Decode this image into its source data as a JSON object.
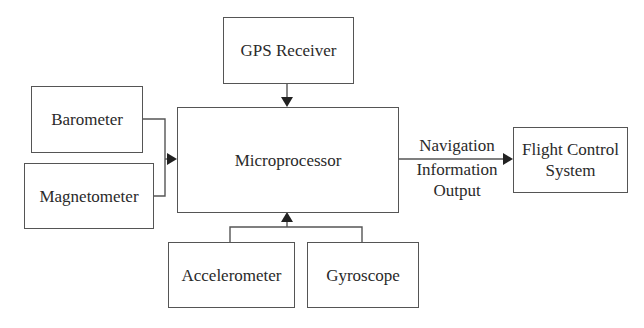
{
  "diagram": {
    "blocks": {
      "gps": "GPS Receiver",
      "barometer": "Barometer",
      "magnetometer": "Magnetometer",
      "microprocessor": "Microprocessor",
      "accelerometer": "Accelerometer",
      "gyroscope": "Gyroscope",
      "flight_control_line1": "Flight Control",
      "flight_control_line2": "System"
    },
    "output_label": {
      "line1": "Navigation",
      "line2": "Information",
      "line3": "Output"
    },
    "edges": [
      {
        "from": "GPS Receiver",
        "to": "Microprocessor"
      },
      {
        "from": "Barometer",
        "to": "Microprocessor"
      },
      {
        "from": "Magnetometer",
        "to": "Microprocessor"
      },
      {
        "from": "Accelerometer",
        "to": "Microprocessor"
      },
      {
        "from": "Gyroscope",
        "to": "Microprocessor"
      },
      {
        "from": "Microprocessor",
        "to": "Flight Control System",
        "label": "Navigation Information Output"
      }
    ]
  }
}
